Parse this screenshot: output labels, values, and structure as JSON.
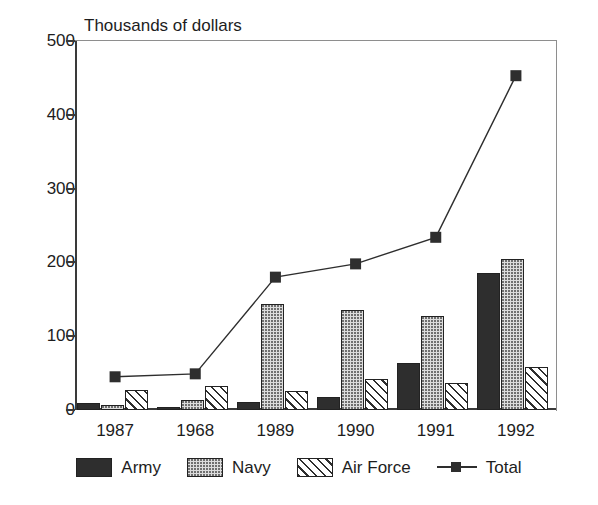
{
  "chart_data": {
    "type": "bar",
    "title": "Thousands of dollars",
    "xlabel": "",
    "ylabel": "Thousands of dollars",
    "categories": [
      "1987",
      "1968",
      "1989",
      "1990",
      "1991",
      "1992"
    ],
    "ylim": [
      0,
      500
    ],
    "yticks": [
      0,
      100,
      200,
      300,
      400,
      500
    ],
    "ytick_labels": [
      "0",
      "100",
      "200",
      "300",
      "400",
      "500"
    ],
    "grid": false,
    "legend_position": "bottom",
    "series": [
      {
        "name": "Army",
        "type": "bar",
        "pattern": "solid-dark",
        "values": [
          10,
          4,
          11,
          17,
          64,
          186
        ]
      },
      {
        "name": "Navy",
        "type": "bar",
        "pattern": "dotted-light",
        "values": [
          7,
          13,
          143,
          136,
          128,
          204
        ]
      },
      {
        "name": "Air Force",
        "type": "bar",
        "pattern": "diagonal-hatch",
        "values": [
          27,
          32,
          26,
          42,
          36,
          58
        ]
      },
      {
        "name": "Total",
        "type": "line",
        "marker": "square",
        "values": [
          45,
          49,
          180,
          198,
          234,
          453
        ]
      }
    ]
  },
  "legend": {
    "items": [
      {
        "label": "Army",
        "swatch": "army-swatch"
      },
      {
        "label": "Navy",
        "swatch": "navy-swatch"
      },
      {
        "label": "Air Force",
        "swatch": "air-force-swatch"
      },
      {
        "label": "Total",
        "swatch": "total-line-swatch"
      }
    ]
  },
  "colors": {
    "army": "#2e2e2e",
    "navy": "#dcdcdc",
    "air_force": "#ffffff",
    "total_line": "#2e2e2e",
    "axis": "#3a3a3a",
    "text": "#1d1d1d",
    "background": "#ffffff"
  },
  "artifacts": {
    "top_text_fragment": "",
    "bottom_text_fragment": ""
  }
}
